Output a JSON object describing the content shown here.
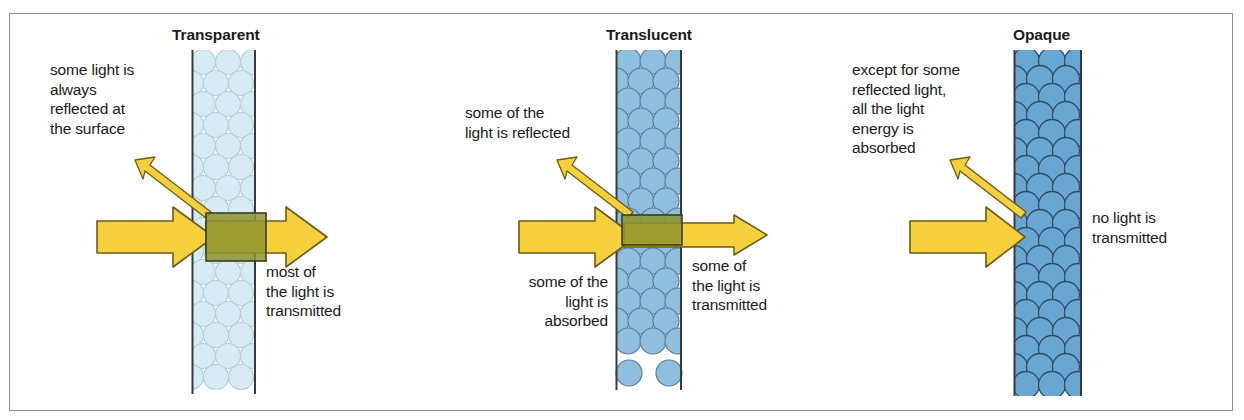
{
  "figure": {
    "kind": "science-diagram",
    "background_color": "#ffffff",
    "frame_color": "#8f8f8f"
  },
  "palette": {
    "arrow_fill": "#f7d13d",
    "arrow_stroke": "#6b5a17",
    "overlap_fill": "#8f9430",
    "overlap_stroke": "#3d3d1a",
    "transparent_atom_fill": "#d6ecf4",
    "transparent_atom_stroke": "#b6cdd6",
    "translucent_atom_fill": "#8fbede",
    "translucent_atom_stroke": "#5a7f99",
    "opaque_atom_fill": "#6aa6d2",
    "opaque_atom_stroke": "#2f4f6b",
    "slab_edge": "#3a3a3a",
    "text_color": "#1a1a1a"
  },
  "panels": [
    {
      "id": "transparent",
      "title": "Transparent",
      "incident_label": "some light is\nalways\nreflected at\nthe surface",
      "output_label": "most of\nthe light is\ntransmitted",
      "extra_label": null,
      "atom_fill": "#d6ecf4",
      "atom_stroke": "#b6cdd6",
      "transmits": true,
      "transmitted_amount": "most"
    },
    {
      "id": "translucent",
      "title": "Translucent",
      "incident_label": "some of the\nlight is reflected",
      "output_label": "some of\nthe light is\ntransmitted",
      "extra_label": "some of the\nlight is\nabsorbed",
      "atom_fill": "#8fbede",
      "atom_stroke": "#5a7f99",
      "transmits": true,
      "transmitted_amount": "some"
    },
    {
      "id": "opaque",
      "title": "Opaque",
      "incident_label": "except for some\nreflected light,\nall the light\nenergy is\nabsorbed",
      "output_label": "no light is\ntransmitted",
      "extra_label": null,
      "atom_fill": "#6aa6d2",
      "atom_stroke": "#2f4f6b",
      "transmits": false,
      "transmitted_amount": "none"
    }
  ],
  "arrows": {
    "incident_name": "incident-light-arrow",
    "reflected_name": "reflected-light-arrow",
    "transmitted_name": "transmitted-light-arrow"
  }
}
